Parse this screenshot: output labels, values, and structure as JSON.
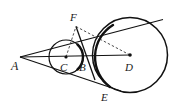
{
  "figure": {
    "type": "geometry-diagram",
    "background_color": "#ffffff",
    "stroke_color": "#111111",
    "dash_color": "#444444",
    "labels": {
      "A": "A",
      "B": "B",
      "C": "C",
      "D": "D",
      "E": "E",
      "F": "F"
    },
    "points": {
      "A": {
        "x": 20,
        "y": 57,
        "label_x": 13,
        "label_y": 68,
        "dot": false
      },
      "B": {
        "x": 83,
        "y": 58,
        "label_x": 80,
        "label_y": 70,
        "dot": false
      },
      "C": {
        "x": 66,
        "y": 57,
        "label_x": 61,
        "label_y": 71,
        "dot": true
      },
      "D": {
        "x": 130,
        "y": 55,
        "label_x": 126,
        "label_y": 70,
        "dot": true
      },
      "E": {
        "x": 108,
        "y": 86,
        "label_x": 102,
        "label_y": 100,
        "dot": false
      },
      "F": {
        "x": 76,
        "y": 26,
        "label_x": 71,
        "label_y": 20,
        "dot": false
      }
    },
    "circles": [
      {
        "name": "small-circle-C",
        "cx": 66,
        "cy": 57,
        "r": 17,
        "stroke_width": 1.2
      },
      {
        "name": "large-circle-D",
        "cx": 130,
        "cy": 55,
        "r": 37.5,
        "stroke_width": 1.5
      }
    ],
    "solid_lines": [
      {
        "name": "tangent-upper-A-to-large-circle",
        "x1": 20,
        "y1": 57,
        "x2": 162,
        "y2": 20
      },
      {
        "name": "tangent-lower-A-to-large-circle",
        "x1": 20,
        "y1": 57,
        "x2": 118,
        "y2": 90
      },
      {
        "name": "center-line-A-to-D",
        "x1": 20,
        "y1": 57,
        "x2": 130,
        "y2": 55
      },
      {
        "name": "chord-F-to-E",
        "x1": 76,
        "y1": 26,
        "x2": 96,
        "y2": 79
      }
    ],
    "dashed_lines": [
      {
        "name": "radius-C-to-F",
        "x1": 66,
        "y1": 57,
        "x2": 76,
        "y2": 26
      },
      {
        "name": "segment-F-to-D",
        "x1": 76,
        "y1": 26,
        "x2": 130,
        "y2": 55
      }
    ],
    "arcs": [
      {
        "name": "small-circle-right-arc-thick",
        "d": "M 77 41 A 17 17 0 0 1 77 73",
        "stroke_width": 2.2
      },
      {
        "name": "large-circle-left-arc-thick",
        "d": "M 112 23 A 37.5 37.5 0 0 0 109 89",
        "stroke_width": 2.2
      }
    ]
  }
}
